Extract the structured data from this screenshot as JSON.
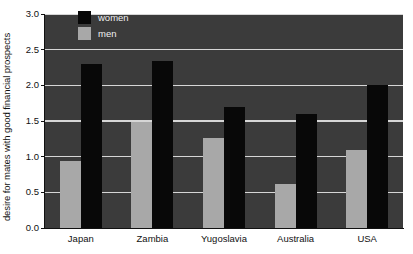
{
  "chart_data": {
    "type": "bar",
    "title": "",
    "xlabel": "",
    "ylabel": "desire for mates with good financial prospects",
    "ylim": [
      0.0,
      3.0
    ],
    "ytick_labels": [
      "0.0",
      "0.5",
      "1.0",
      "1.5",
      "2.0",
      "2.5",
      "3.0"
    ],
    "ytick_values": [
      0.0,
      0.5,
      1.0,
      1.5,
      2.0,
      2.5,
      3.0
    ],
    "grid": true,
    "legend_position": "top-left-inside",
    "categories": [
      "Japan",
      "Zambia",
      "Yugoslavia",
      "Australia",
      "USA"
    ],
    "series": [
      {
        "name": "women",
        "color": "#080808",
        "values": [
          2.3,
          2.34,
          1.7,
          1.6,
          2.0
        ]
      },
      {
        "name": "men",
        "color": "#a8a8a8",
        "values": [
          0.94,
          1.48,
          1.26,
          0.62,
          1.1
        ]
      }
    ],
    "plot_background": "#3b3b3b",
    "gridline_color": "#d6d6d6",
    "figure_background": "#ffffff"
  },
  "axis": {
    "y_title": "desire for mates with good financial prospects"
  },
  "legend": {
    "items": [
      {
        "label": "women"
      },
      {
        "label": "men"
      }
    ]
  }
}
